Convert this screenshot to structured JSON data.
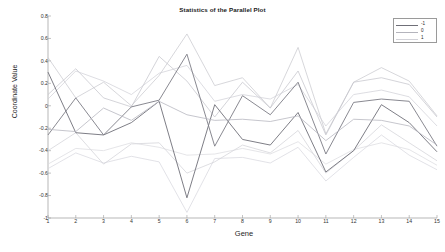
{
  "chart_data": {
    "type": "line",
    "title": "Statistics of the Parallel Plot",
    "xlabel": "Gene",
    "ylabel": "Coordinate Value",
    "xlim": [
      1,
      15
    ],
    "ylim": [
      -1,
      0.8
    ],
    "grid": false,
    "legend_position": "top-right",
    "x": [
      1,
      2,
      3,
      4,
      5,
      6,
      7,
      8,
      9,
      10,
      11,
      12,
      13,
      14,
      15
    ],
    "xtick_labels": [
      "1",
      "2",
      "3",
      "4",
      "5",
      "6",
      "7",
      "8",
      "9",
      "10",
      "11",
      "12",
      "13",
      "14",
      "15"
    ],
    "ytick_labels": [
      "0.8",
      "0.6",
      "0.4",
      "0.2",
      "0",
      "-0.2",
      "-0.4",
      "-0.6",
      "-0.8",
      "-1"
    ],
    "ytick_values": [
      0.8,
      0.6,
      0.4,
      0.2,
      0,
      -0.2,
      -0.4,
      -0.6,
      -0.8,
      -1
    ],
    "legend": [
      {
        "label": "-1",
        "color": "#6f6f78"
      },
      {
        "label": "0",
        "color": "#b4b4bc"
      },
      {
        "label": "1",
        "color": "#d2d2d8"
      }
    ],
    "series": [
      {
        "name": "-1 mean",
        "group": "-1",
        "role": "mean",
        "color": "#6f6f78",
        "width": 0.9,
        "values": [
          0.3,
          -0.24,
          -0.26,
          -0.15,
          0.04,
          -0.82,
          0.01,
          -0.3,
          -0.35,
          -0.06,
          -0.59,
          -0.4,
          0.01,
          -0.15,
          -0.41
        ]
      },
      {
        "name": "-1 upper",
        "group": "-1",
        "role": "band",
        "color": "#c6c6cc",
        "width": 0.7,
        "values": [
          0.43,
          0.07,
          0.21,
          0.0,
          0.27,
          0.64,
          0.18,
          0.25,
          -0.02,
          0.52,
          -0.25,
          0.21,
          0.34,
          0.22,
          -0.09
        ]
      },
      {
        "name": "-1 lower",
        "group": "-1",
        "role": "band",
        "color": "#d6d6dc",
        "width": 0.7,
        "values": [
          -0.56,
          -0.42,
          -0.51,
          -0.45,
          -0.5,
          -0.95,
          -0.47,
          -0.46,
          -0.51,
          -0.37,
          -0.67,
          -0.46,
          -0.26,
          -0.44,
          -0.57
        ]
      },
      {
        "name": "0 mean",
        "group": "0",
        "role": "mean",
        "color": "#7c7c85",
        "width": 0.9,
        "values": [
          -0.26,
          0.07,
          -0.26,
          -0.01,
          0.05,
          0.46,
          -0.36,
          0.09,
          -0.08,
          0.21,
          -0.43,
          0.03,
          0.06,
          0.04,
          -0.36
        ]
      },
      {
        "name": "0 upper",
        "group": "0",
        "role": "band",
        "color": "#c2c2c9",
        "width": 0.7,
        "values": [
          0.1,
          0.33,
          0.07,
          -0.01,
          0.44,
          0.22,
          -0.1,
          0.21,
          -0.02,
          0.31,
          -0.26,
          0.21,
          0.25,
          0.19,
          -0.1
        ]
      },
      {
        "name": "0 lower",
        "group": "0",
        "role": "band",
        "color": "#d0d0d6",
        "width": 0.7,
        "values": [
          -0.4,
          -0.24,
          -0.52,
          -0.34,
          -0.33,
          -0.6,
          -0.5,
          -0.35,
          -0.42,
          -0.22,
          -0.6,
          -0.4,
          -0.17,
          -0.33,
          -0.49
        ]
      },
      {
        "name": "1 mean",
        "group": "1",
        "role": "mean",
        "color": "#b8b8c0",
        "width": 0.8,
        "values": [
          -0.21,
          -0.23,
          -0.02,
          -0.13,
          0.04,
          -0.08,
          -0.13,
          -0.12,
          -0.14,
          -0.09,
          -0.31,
          -0.12,
          -0.13,
          -0.18,
          -0.35
        ]
      },
      {
        "name": "1 upper",
        "group": "1",
        "role": "band",
        "color": "#cfcfd5",
        "width": 0.7,
        "values": [
          0.06,
          0.31,
          0.22,
          0.1,
          0.29,
          0.36,
          0.04,
          0.1,
          0.06,
          0.19,
          -0.18,
          0.1,
          0.14,
          0.08,
          -0.18
        ]
      },
      {
        "name": "1 lower",
        "group": "1",
        "role": "band",
        "color": "#dadade",
        "width": 0.7,
        "values": [
          -0.52,
          -0.38,
          -0.4,
          -0.33,
          -0.37,
          -0.44,
          -0.43,
          -0.38,
          -0.43,
          -0.32,
          -0.52,
          -0.39,
          -0.33,
          -0.39,
          -0.53
        ]
      }
    ]
  },
  "figure": {
    "background": "#ffffff",
    "axis_color": "#9a9a9a",
    "caption_fragment": ""
  }
}
